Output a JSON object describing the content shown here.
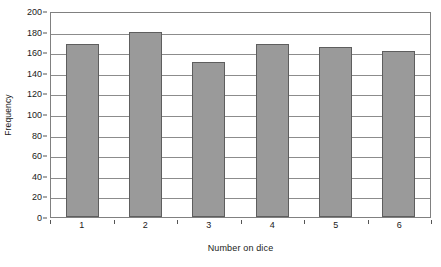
{
  "chart_data": {
    "type": "bar",
    "title": "",
    "xlabel": "Number on dice",
    "ylabel": "Frequency",
    "categories": [
      "1",
      "2",
      "3",
      "4",
      "5",
      "6"
    ],
    "values": [
      170,
      181,
      152,
      170,
      167,
      163
    ],
    "series": [
      {
        "name": "Frequency",
        "values": [
          170,
          181,
          152,
          170,
          167,
          163
        ]
      }
    ],
    "ylim": [
      0,
      200
    ],
    "ytick_step": 20,
    "yticks": [
      0,
      20,
      40,
      60,
      80,
      100,
      120,
      140,
      160,
      180,
      200
    ],
    "ytick_labels": [
      "0",
      "20",
      "40",
      "60",
      "80",
      "100",
      "120",
      "140",
      "160",
      "180",
      "200"
    ],
    "grid": "horizontal",
    "legend": "none",
    "bar_color": "#9a9a9a",
    "bar_border_color": "#5e5e5e",
    "gridline_color": "#8c8c8c",
    "plot_border_color": "#808080",
    "background_color": "#ffffff",
    "text_color": "#1a1a1a"
  }
}
